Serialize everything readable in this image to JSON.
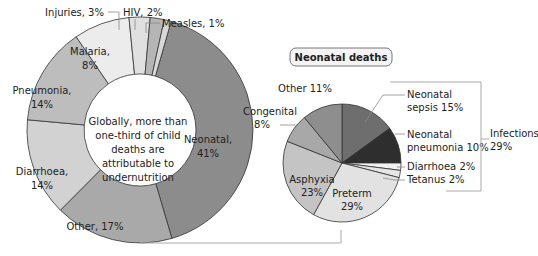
{
  "chart_data": [
    {
      "type": "pie",
      "variant": "donut",
      "title": "",
      "center_text": "Globally, more than one-third of child deaths are attributable to undernutrition",
      "categories": [
        "Neonatal",
        "Other",
        "Diarrhoea",
        "Pneumonia",
        "Malaria",
        "Injuries",
        "HIV",
        "Measles"
      ],
      "values": [
        41,
        17,
        14,
        14,
        8,
        3,
        2,
        1
      ],
      "labels": [
        "Neonatal, 41%",
        "Other, 17%",
        "Diarrhoea, 14%",
        "Pneumonia, 14%",
        "Malaria, 8%",
        "Injuries, 3%",
        "HIV, 2%",
        "Measles, 1%"
      ],
      "colors": [
        "#8c8c8c",
        "#a9a9a9",
        "#d2d2d2",
        "#bdbdbd",
        "#ececec",
        "#e0e0e0",
        "#b5b5b5",
        "#d8d8d8"
      ]
    },
    {
      "type": "pie",
      "title": "Neonatal deaths",
      "categories": [
        "Neonatal sepsis",
        "Neonatal pneumonia",
        "Diarrhoea",
        "Tetanus",
        "Preterm",
        "Asphyxia",
        "Congenital",
        "Other"
      ],
      "values": [
        15,
        10,
        2,
        2,
        29,
        23,
        8,
        11
      ],
      "labels": [
        "Neonatal sepsis 15%",
        "Neonatal pneumonia 10%",
        "Diarrhoea 2%",
        "Tetanus 2%",
        "Preterm 29%",
        "Asphyxia 23%",
        "Congenital 8%",
        "Other 11%"
      ],
      "colors": [
        "#6e6e6e",
        "#2e2e2e",
        "#f2f2f2",
        "#e6e6e6",
        "#e2e2e2",
        "#c4c4c4",
        "#a8a8a8",
        "#8e8e8e"
      ],
      "group_annotation": {
        "label": "Infections",
        "value": "29%",
        "members": [
          "Neonatal sepsis",
          "Neonatal pneumonia",
          "Diarrhoea",
          "Tetanus"
        ]
      }
    }
  ],
  "donut": {
    "center_lines": [
      "Globally, more than",
      "one-third of child",
      "deaths are",
      "attributable to",
      "undernutrition"
    ],
    "labels": {
      "neonatal": [
        "Neonatal,",
        "41%"
      ],
      "other": "Other, 17%",
      "diarrhoea": [
        "Diarrhoea,",
        "14%"
      ],
      "pneumonia": [
        "Pneumonia,",
        "14%"
      ],
      "malaria": [
        "Malaria,",
        "8%"
      ],
      "injuries": "Injuries, 3%",
      "hiv": "HIV, 2%",
      "measles": "Measles, 1%"
    }
  },
  "pie": {
    "title": "Neonatal deaths",
    "labels": {
      "sepsis": [
        "Neonatal",
        "sepsis 15%"
      ],
      "pneumonia": [
        "Neonatal",
        "pneumonia 10%"
      ],
      "diarrhoea": "Diarrhoea 2%",
      "tetanus": "Tetanus 2%",
      "preterm": [
        "Preterm",
        "29%"
      ],
      "asphyxia": [
        "Asphyxia",
        "23%"
      ],
      "congenital": [
        "Congenital",
        "8%"
      ],
      "other": "Other 11%"
    },
    "infections": [
      "Infections",
      "29%"
    ]
  }
}
